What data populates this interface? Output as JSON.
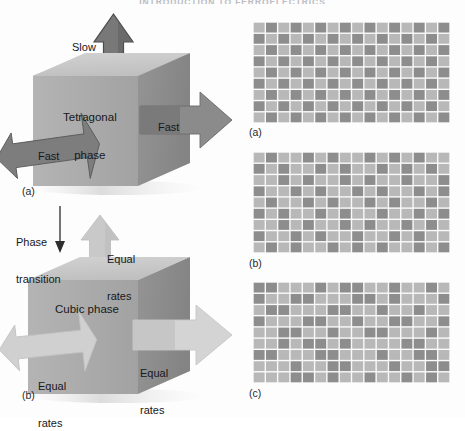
{
  "header": {
    "running_title": "INTRODUCTION TO FERROELECTRICS"
  },
  "figure": {
    "left_diagrams": {
      "tetragonal": {
        "panel_label": "(a)",
        "cube_label_line1": "Tetragonal",
        "cube_label_line2": "phase",
        "arrow_up_label": "Slow",
        "arrow_left_label": "Fast",
        "arrow_right_label": "Fast"
      },
      "transition": {
        "label_line1": "Phase",
        "label_line2": "transition"
      },
      "cubic": {
        "panel_label": "(b)",
        "cube_label": "Cubic phase",
        "arrow_up_label_line1": "Equal",
        "arrow_up_label_line2": "rates",
        "arrow_left_label_line1": "Equal",
        "arrow_left_label_line2": "rates",
        "arrow_right_label_line1": "Equal",
        "arrow_right_label_line2": "rates"
      }
    },
    "right_grids": [
      {
        "caption": "(a)"
      },
      {
        "caption": "(b)"
      },
      {
        "caption": "(c)"
      }
    ]
  },
  "chart_data": {
    "type": "heatmap",
    "cols": 16,
    "rows": 9,
    "legend": [
      "dark-tile",
      "light-tile"
    ],
    "colors": {
      "dark_tile": "#8d8d8d",
      "light_tile": "#b8b8b8",
      "gap": "#fafafa",
      "cube_top": "#c8c8c8",
      "cube_front": "#a9a9a9",
      "cube_side": "#8c8c8c",
      "arrow_dark": "#7b7b7b",
      "arrow_light": "#cfcfcf",
      "text": "#17181a"
    },
    "panels": [
      {
        "label": "(a)",
        "matrix": [
          [
            1,
            0,
            1,
            0,
            1,
            0,
            1,
            0,
            1,
            0,
            1,
            0,
            1,
            0,
            1,
            0
          ],
          [
            0,
            1,
            0,
            1,
            0,
            1,
            0,
            1,
            0,
            1,
            0,
            1,
            0,
            1,
            0,
            1
          ],
          [
            1,
            0,
            1,
            0,
            1,
            0,
            1,
            0,
            1,
            0,
            1,
            0,
            1,
            0,
            1,
            0
          ],
          [
            0,
            1,
            0,
            1,
            0,
            1,
            0,
            1,
            0,
            1,
            0,
            1,
            0,
            1,
            0,
            1
          ],
          [
            1,
            0,
            1,
            0,
            1,
            0,
            1,
            0,
            1,
            0,
            1,
            0,
            1,
            0,
            1,
            0
          ],
          [
            0,
            1,
            0,
            1,
            0,
            1,
            0,
            1,
            0,
            1,
            0,
            1,
            0,
            1,
            0,
            1
          ],
          [
            1,
            0,
            1,
            0,
            1,
            0,
            1,
            0,
            1,
            0,
            1,
            0,
            1,
            0,
            1,
            0
          ],
          [
            0,
            1,
            0,
            1,
            0,
            1,
            0,
            1,
            0,
            1,
            0,
            1,
            0,
            1,
            0,
            1
          ],
          [
            1,
            0,
            1,
            0,
            1,
            0,
            1,
            0,
            1,
            0,
            1,
            0,
            1,
            0,
            1,
            0
          ]
        ]
      },
      {
        "label": "(b)",
        "matrix": [
          [
            1,
            0,
            1,
            1,
            0,
            1,
            0,
            1,
            1,
            0,
            1,
            0,
            1,
            0,
            1,
            1
          ],
          [
            0,
            1,
            0,
            1,
            1,
            0,
            1,
            0,
            1,
            1,
            0,
            1,
            0,
            1,
            0,
            1
          ],
          [
            1,
            1,
            0,
            1,
            0,
            1,
            1,
            0,
            1,
            0,
            1,
            1,
            0,
            1,
            1,
            0
          ],
          [
            0,
            1,
            1,
            0,
            1,
            0,
            1,
            1,
            0,
            1,
            0,
            1,
            1,
            0,
            1,
            0
          ],
          [
            1,
            0,
            1,
            1,
            0,
            1,
            0,
            1,
            1,
            0,
            1,
            0,
            1,
            1,
            0,
            1
          ],
          [
            0,
            1,
            0,
            1,
            1,
            0,
            1,
            0,
            1,
            1,
            0,
            1,
            1,
            0,
            1,
            0
          ],
          [
            1,
            1,
            0,
            1,
            0,
            1,
            1,
            0,
            1,
            0,
            1,
            1,
            0,
            1,
            0,
            1
          ],
          [
            0,
            1,
            1,
            0,
            1,
            0,
            1,
            1,
            0,
            1,
            1,
            0,
            1,
            0,
            1,
            1
          ],
          [
            1,
            0,
            1,
            0,
            1,
            1,
            0,
            1,
            0,
            1,
            0,
            1,
            1,
            0,
            1,
            0
          ]
        ]
      },
      {
        "label": "(c)",
        "matrix": [
          [
            0,
            0,
            1,
            1,
            1,
            0,
            1,
            0,
            0,
            1,
            1,
            0,
            1,
            1,
            0,
            1
          ],
          [
            0,
            1,
            1,
            0,
            0,
            1,
            1,
            1,
            0,
            0,
            1,
            0,
            1,
            1,
            1,
            0
          ],
          [
            1,
            0,
            0,
            1,
            1,
            1,
            0,
            0,
            1,
            1,
            0,
            1,
            1,
            0,
            1,
            1
          ],
          [
            0,
            1,
            1,
            1,
            0,
            0,
            1,
            1,
            0,
            1,
            1,
            0,
            0,
            1,
            1,
            0
          ],
          [
            1,
            1,
            0,
            0,
            1,
            1,
            0,
            1,
            1,
            0,
            0,
            1,
            1,
            1,
            0,
            1
          ],
          [
            1,
            1,
            0,
            1,
            0,
            0,
            1,
            0,
            1,
            1,
            1,
            1,
            0,
            0,
            1,
            1
          ],
          [
            0,
            0,
            1,
            1,
            1,
            0,
            0,
            1,
            1,
            1,
            0,
            1,
            1,
            0,
            0,
            1
          ],
          [
            1,
            1,
            1,
            0,
            1,
            1,
            0,
            0,
            1,
            1,
            1,
            0,
            1,
            1,
            0,
            0
          ],
          [
            1,
            1,
            1,
            0,
            0,
            1,
            0,
            1,
            1,
            0,
            1,
            1,
            0,
            1,
            0,
            1
          ]
        ]
      }
    ]
  }
}
